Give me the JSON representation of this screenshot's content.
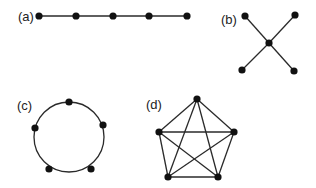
{
  "colors": {
    "edge": "#2a2a2a",
    "node": "#111111",
    "label": "#222222",
    "background": "#ffffff"
  },
  "panels": [
    {
      "id": "a",
      "label": "(a)",
      "type": "path-graph",
      "label_pos": [
        18,
        21
      ],
      "nodes": [
        [
          39,
          16
        ],
        [
          76,
          16
        ],
        [
          113,
          16
        ],
        [
          149,
          16
        ],
        [
          187,
          16
        ]
      ],
      "edges": [
        [
          0,
          1
        ],
        [
          1,
          2
        ],
        [
          2,
          3
        ],
        [
          3,
          4
        ]
      ]
    },
    {
      "id": "b",
      "label": "(b)",
      "type": "star-graph",
      "label_pos": [
        221,
        24
      ],
      "nodes": [
        [
          269,
          43
        ],
        [
          245,
          16
        ],
        [
          295,
          15
        ],
        [
          242,
          70
        ],
        [
          294,
          71
        ]
      ],
      "edges": [
        [
          0,
          1
        ],
        [
          0,
          2
        ],
        [
          0,
          3
        ],
        [
          0,
          4
        ]
      ]
    },
    {
      "id": "c",
      "label": "(c)",
      "type": "cycle-graph",
      "label_pos": [
        17,
        110
      ],
      "circle": {
        "cx": 69,
        "cy": 137,
        "r": 35
      },
      "nodes": [
        [
          69,
          102
        ],
        [
          103,
          125
        ],
        [
          35,
          128
        ],
        [
          49,
          169
        ],
        [
          91,
          169
        ]
      ],
      "edges": []
    },
    {
      "id": "d",
      "label": "(d)",
      "type": "complete-graph-K5",
      "label_pos": [
        146,
        109
      ],
      "nodes": [
        [
          197,
          99
        ],
        [
          159,
          132
        ],
        [
          234,
          132
        ],
        [
          168,
          177
        ],
        [
          218,
          177
        ]
      ],
      "edges": [
        [
          0,
          1
        ],
        [
          0,
          2
        ],
        [
          0,
          3
        ],
        [
          0,
          4
        ],
        [
          1,
          2
        ],
        [
          1,
          3
        ],
        [
          1,
          4
        ],
        [
          2,
          3
        ],
        [
          2,
          4
        ],
        [
          3,
          4
        ]
      ]
    }
  ]
}
